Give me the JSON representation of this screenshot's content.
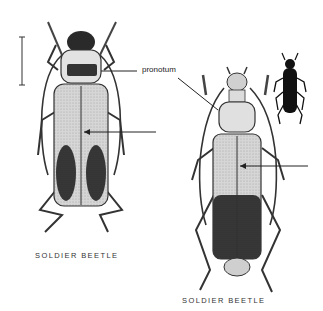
{
  "illustration": {
    "subject": "Soldier beetle anatomy illustration",
    "labels": {
      "pronotum": "pronotum"
    },
    "captions": {
      "left": "SOLDIER BEETLE",
      "right": "SOLDIER BEETLE"
    },
    "colors": {
      "background": "#ffffff",
      "ink": "#1a1a1a",
      "body_light": "#d8d8d8",
      "body_dark": "#2a2a2a"
    }
  }
}
